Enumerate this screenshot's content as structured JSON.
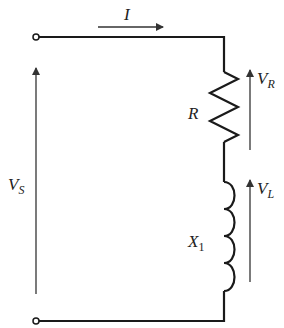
{
  "diagram": {
    "type": "series RL circuit",
    "colors": {
      "wire": "#1a1a1a",
      "arrow": "#333333",
      "text": "#222222",
      "background": "#ffffff"
    },
    "labels": {
      "current": "I",
      "source_voltage": {
        "main": "V",
        "sub": "S"
      },
      "resistor_voltage": {
        "main": "V",
        "sub": "R"
      },
      "inductor_voltage": {
        "main": "V",
        "sub": "L"
      },
      "resistor": "R",
      "inductor": {
        "main": "X",
        "sub": "1"
      }
    },
    "components": [
      {
        "id": "terminal-top",
        "kind": "terminal"
      },
      {
        "id": "terminal-bottom",
        "kind": "terminal"
      },
      {
        "id": "resistor",
        "kind": "resistor",
        "label": "R"
      },
      {
        "id": "inductor",
        "kind": "inductor",
        "label": "X1"
      }
    ],
    "arrows": [
      {
        "id": "current-arrow",
        "direction": "right",
        "label": "I"
      },
      {
        "id": "vs-arrow",
        "direction": "up",
        "label": "VS"
      },
      {
        "id": "vr-arrow",
        "direction": "up",
        "label": "VR"
      },
      {
        "id": "vl-arrow",
        "direction": "up",
        "label": "VL"
      }
    ]
  }
}
